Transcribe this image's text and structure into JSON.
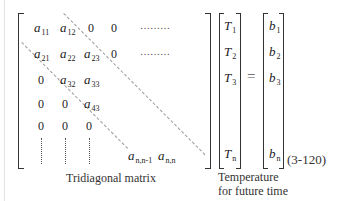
{
  "equation_number": "(3-120)",
  "matrix": {
    "caption": "Tridiagonal matrix",
    "rows": [
      [
        {
          "v": "a",
          "s": "11"
        },
        {
          "v": "a",
          "s": "12"
        },
        "0",
        "0",
        "………"
      ],
      [
        {
          "v": "a",
          "s": "21"
        },
        {
          "v": "a",
          "s": "22"
        },
        {
          "v": "a",
          "s": "23"
        },
        "0",
        "………"
      ],
      [
        "0",
        {
          "v": "a",
          "s": "32"
        },
        {
          "v": "a",
          "s": "33"
        }
      ],
      [
        "0",
        "0",
        {
          "v": "a",
          "s": "43"
        }
      ],
      [
        "0",
        "0",
        "0"
      ]
    ],
    "last_row": [
      {
        "v": "a",
        "s": "n,n-1"
      },
      {
        "v": "a",
        "s": "n,n"
      }
    ]
  },
  "unknown_vector": {
    "caption_line1": "Temperature",
    "caption_line2": "for future time",
    "entries": [
      {
        "v": "T",
        "s": "1"
      },
      {
        "v": "T",
        "s": "2"
      },
      {
        "v": "T",
        "s": "3"
      },
      {
        "v": "T",
        "s": "n"
      }
    ]
  },
  "equals": "=",
  "rhs_vector": {
    "entries": [
      {
        "v": "b",
        "s": "1"
      },
      {
        "v": "b",
        "s": "2"
      },
      {
        "v": "b",
        "s": "3"
      },
      {
        "v": "b",
        "s": "n"
      }
    ]
  }
}
